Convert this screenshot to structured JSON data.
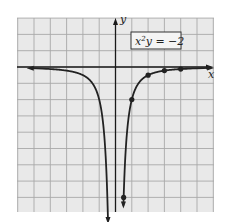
{
  "chart_data": {
    "type": "line",
    "title": "",
    "equation_label": "x²y = −2",
    "equation_parts": {
      "base": "x",
      "exp": "2",
      "rest": "y = −2"
    },
    "function": "y = -2/x^2",
    "xlabel": "x",
    "ylabel": "y",
    "xlim": [
      -6,
      6
    ],
    "ylim": [
      -8.8,
      3
    ],
    "grid": true,
    "grid_step": 1,
    "series": [
      {
        "name": "x²y = −2",
        "branches": [
          {
            "x_range": [
              -5.2,
              -0.46
            ],
            "arrows": [
              "left",
              "down"
            ]
          },
          {
            "x_range": [
              0.485,
              5.8
            ],
            "arrows": [
              "down",
              "right"
            ]
          }
        ],
        "marked_points": [
          {
            "x": 0.5,
            "y": -8
          },
          {
            "x": 1,
            "y": -2
          },
          {
            "x": 2,
            "y": -0.5
          },
          {
            "x": 3,
            "y": -0.222
          },
          {
            "x": 4,
            "y": -0.125
          }
        ]
      }
    ]
  },
  "colors": {
    "grid_bg": "#e9e9e9",
    "grid_line": "#a8a8a8",
    "axis": "#1a1a1a",
    "curve": "#222222"
  }
}
